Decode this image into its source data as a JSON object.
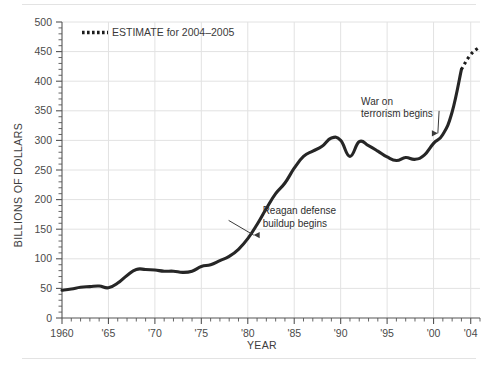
{
  "chart_data": {
    "type": "line",
    "title": "",
    "xlabel": "YEAR",
    "ylabel": "BILLIONS OF DOLLARS",
    "xlim": [
      1960,
      2005
    ],
    "ylim": [
      0,
      500
    ],
    "grid": true,
    "y_ticks": [
      0,
      50,
      100,
      150,
      200,
      250,
      300,
      350,
      400,
      450,
      500
    ],
    "y_tick_labels": [
      "0",
      "50",
      "100",
      "150",
      "200",
      "250",
      "300",
      "350",
      "400",
      "450",
      "500"
    ],
    "y_minor_step": 10,
    "x_ticks": [
      1960,
      1965,
      1970,
      1975,
      1980,
      1985,
      1990,
      1995,
      2000,
      2004
    ],
    "x_tick_labels": [
      "1960",
      "'65",
      "'70",
      "'75",
      "'80",
      "'85",
      "'90",
      "'95",
      "'00",
      "'04"
    ],
    "x_minor_step": 1,
    "legend": {
      "position": "top-left-inside",
      "entries": [
        {
          "label": "ESTIMATE for 2004–2005",
          "style": "dotted",
          "color": "#1c1c1c"
        }
      ]
    },
    "series": [
      {
        "name": "Actual defense spending",
        "style": "solid",
        "color": "#262626",
        "x": [
          1960,
          1961,
          1962,
          1963,
          1964,
          1965,
          1966,
          1967,
          1968,
          1969,
          1970,
          1971,
          1972,
          1973,
          1974,
          1975,
          1976,
          1977,
          1978,
          1979,
          1980,
          1981,
          1982,
          1983,
          1984,
          1985,
          1986,
          1987,
          1988,
          1989,
          1990,
          1991,
          1992,
          1993,
          1994,
          1995,
          1996,
          1997,
          1998,
          1999,
          2000,
          2001,
          2002,
          2003
        ],
        "y": [
          47,
          49,
          52,
          53,
          54,
          51,
          59,
          72,
          82,
          82,
          81,
          79,
          79,
          77,
          79,
          87,
          90,
          97,
          104,
          116,
          134,
          158,
          185,
          210,
          228,
          253,
          273,
          282,
          290,
          304,
          300,
          273,
          298,
          291,
          282,
          272,
          266,
          271,
          268,
          275,
          295,
          310,
          348,
          420
        ]
      },
      {
        "name": "ESTIMATE for 2004–2005",
        "style": "dotted",
        "color": "#1c1c1c",
        "x": [
          2003,
          2004,
          2005
        ],
        "y": [
          420,
          445,
          458
        ]
      }
    ],
    "annotations": [
      {
        "text_lines": [
          "Reagan defense",
          "buildup begins"
        ],
        "text_x": 1981.6,
        "text_y": 175,
        "arrow_to_x": 1980.1,
        "arrow_to_y": 140,
        "arrow_direction": "left"
      },
      {
        "text_lines": [
          "War on",
          "terrorism begins"
        ],
        "text_x": 1992.2,
        "text_y": 360,
        "arrow_to_x": 2001.0,
        "arrow_to_y": 312,
        "arrow_direction": "right"
      }
    ]
  }
}
